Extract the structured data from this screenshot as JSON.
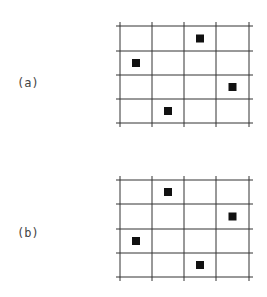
{
  "panels": [
    {
      "label": "(a)",
      "label_pos": {
        "x": 17,
        "y": 84
      },
      "grid": {
        "rows": 4,
        "cols": 4,
        "x_lines": [
          120,
          152,
          184,
          216,
          249
        ],
        "y_lines": [
          26,
          51,
          75,
          99,
          123
        ]
      },
      "filled_cells": [
        {
          "row": 0,
          "col": 2
        },
        {
          "row": 1,
          "col": 0
        },
        {
          "row": 2,
          "col": 3
        },
        {
          "row": 3,
          "col": 1
        }
      ]
    },
    {
      "label": "(b)",
      "label_pos": {
        "x": 17,
        "y": 234
      },
      "grid": {
        "rows": 4,
        "cols": 4,
        "x_lines": [
          120,
          152,
          184,
          216,
          249
        ],
        "y_lines": [
          180,
          204,
          229,
          253,
          277
        ]
      },
      "filled_cells": [
        {
          "row": 0,
          "col": 1
        },
        {
          "row": 1,
          "col": 3
        },
        {
          "row": 2,
          "col": 0
        },
        {
          "row": 3,
          "col": 2
        }
      ]
    }
  ],
  "style": {
    "line_color": "#333333",
    "square_color": "#111111",
    "square_size": 8
  }
}
